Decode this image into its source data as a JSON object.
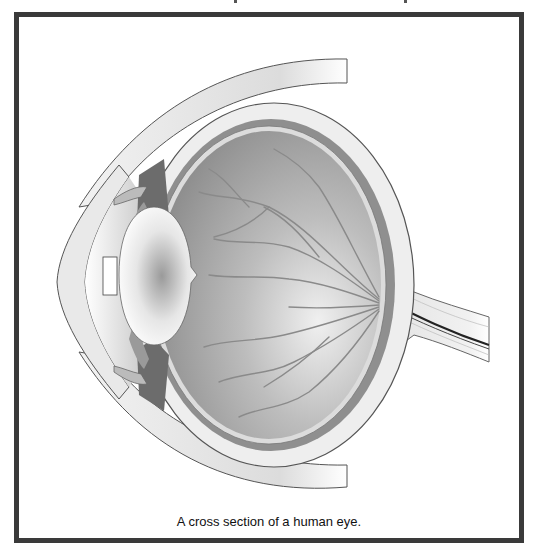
{
  "figure": {
    "caption": "A cross section of a human eye.",
    "colors": {
      "frame": "#3a3a3a",
      "background": "#ffffff",
      "vitreous": "#9a9a9a",
      "sclera": "#ececec",
      "choroid": "#8c8c8c",
      "vessel": "#7d7d7d",
      "lens": "#f4f4f4",
      "outline": "#555555"
    },
    "parts": [
      "cornea",
      "iris",
      "pupil",
      "lens",
      "ciliary-body",
      "vitreous-body",
      "retina",
      "retinal-vessels",
      "choroid",
      "sclera",
      "optic-nerve",
      "eyelid-upper",
      "eyelid-lower"
    ]
  }
}
